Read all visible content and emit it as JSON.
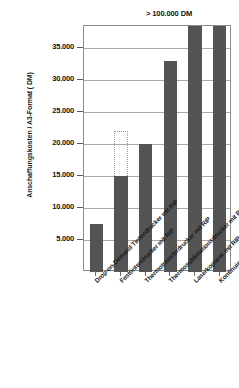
{
  "chart_data": {
    "type": "bar",
    "title": "",
    "xlabel": "",
    "ylabel": "Anschaffungskosten / A3-Format ( DM)",
    "ylim": [
      0,
      38500
    ],
    "ytick_values": [
      5000,
      10000,
      15000,
      20000,
      25000,
      30000,
      35000
    ],
    "ytick_labels": [
      "5.000",
      "10.000",
      "15.000",
      "20.000",
      "25.000",
      "30.000",
      "35.000"
    ],
    "grid": true,
    "legend": false,
    "categories": [
      "Drop-on-Demand Tintendrucker mit RIP",
      "Festtintendrucker mit RIP",
      "Thermotransferdrucker mit RIP",
      "Thermosublimationsdrucker mit RIP",
      "Laserkopierer mit RIP",
      "Kontinuierlicher Tintendrucker mit RIP"
    ],
    "values": [
      7500,
      15000,
      20000,
      33000,
      100000,
      100000
    ],
    "range_extensions": [
      {
        "category_index": 1,
        "from": 15000,
        "to": 22000,
        "style": "dotted-outline"
      }
    ],
    "clipped_bars": [
      4,
      5
    ],
    "annotations": [
      {
        "text": "> 100.000 DM",
        "refers_to": [
          "Laserkopierer mit RIP",
          "Kontinuierlicher Tintendrucker mit RIP"
        ]
      }
    ],
    "colors": {
      "bar": "#545454",
      "ghost_bar_outline": "#9a9a9a",
      "grid": "#a8a8a8",
      "axis": "#8a8a8a",
      "text": "#1a1a1a",
      "background": "#ffffff"
    }
  }
}
